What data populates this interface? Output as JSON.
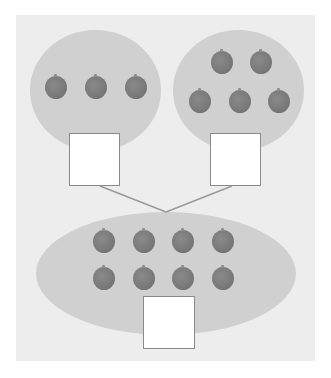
{
  "diagram": {
    "type": "number-bond",
    "colors": {
      "panel": "#ededed",
      "group": "#d0d0d0",
      "apple": "#7a7a7a",
      "box_border": "#8a8a8a",
      "box_fill": "#ffffff",
      "connector": "#9a9a9a"
    },
    "groups": [
      {
        "name": "left-part",
        "apple_count": 3,
        "answer_box": ""
      },
      {
        "name": "right-part",
        "apple_count": 5,
        "answer_box": ""
      },
      {
        "name": "whole",
        "apple_count": 8,
        "answer_box": ""
      }
    ]
  }
}
